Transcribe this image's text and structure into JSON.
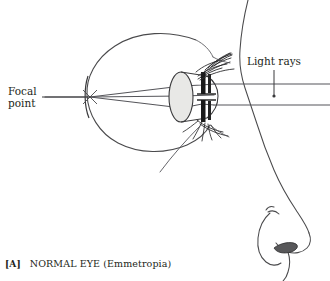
{
  "figure": {
    "caption_tag": "[A]",
    "caption_text": "NORMAL EYE (Emmetropia)",
    "title": "NORMAL EYE (Emmetropia)"
  },
  "labels": {
    "focal_point_line1": "Focal",
    "focal_point_line2": "point",
    "light_rays": "Light rays"
  },
  "colors": {
    "ink": "#231f20",
    "line": "#3a3a3c",
    "ray": "#4a4a4c",
    "lens_fill": "#e6e6e4",
    "iris_dark": "#1a1a1a",
    "background": "#ffffff"
  },
  "diagram": {
    "type": "anatomical-ray-diagram",
    "parts": [
      "globe",
      "retina",
      "lens",
      "cornea",
      "iris",
      "upper-eyelid",
      "lower-eyelid",
      "eyelashes",
      "face-profile",
      "nose",
      "nostril"
    ],
    "rays": {
      "count": 2,
      "incoming_y": [
        84,
        105
      ],
      "entry_x": 330,
      "focal_point": {
        "x": 90,
        "y": 97
      },
      "description": "two parallel rays refract at cornea and lens, crossing at the focal point on the retina"
    }
  }
}
